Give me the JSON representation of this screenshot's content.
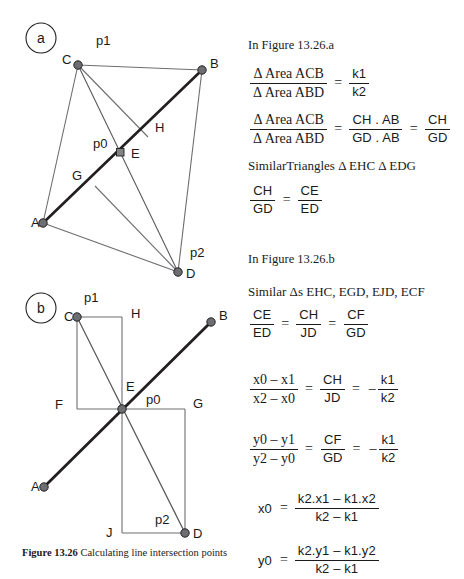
{
  "figure": {
    "caption_label": "Figure 13.26",
    "caption_text": " Calculating line intersection points",
    "panel_a": {
      "badge": "a",
      "points": [
        {
          "id": "A",
          "label": "A",
          "x": 43,
          "y": 223,
          "label_x": 31,
          "label_y": 227
        },
        {
          "id": "B",
          "label": "B",
          "x": 202,
          "y": 70,
          "label_x": 210,
          "label_y": 68
        },
        {
          "id": "C",
          "label": "C",
          "x": 78,
          "y": 65,
          "label_x": 62,
          "label_y": 64
        },
        {
          "id": "D",
          "label": "D",
          "x": 178,
          "y": 272,
          "label_x": 186,
          "label_y": 278
        },
        {
          "id": "E",
          "label": "E",
          "x": 120,
          "y": 152,
          "label_x": 131,
          "label_y": 158
        }
      ],
      "annotations": [
        {
          "id": "p1",
          "label": "p1",
          "x": 96,
          "y": 45
        },
        {
          "id": "p0",
          "label": "p0",
          "x": 93,
          "y": 148
        },
        {
          "id": "p2",
          "label": "p2",
          "x": 190,
          "y": 257
        },
        {
          "id": "G",
          "label": "G",
          "x": 72,
          "y": 180
        },
        {
          "id": "H",
          "label": "H",
          "x": 155,
          "y": 132
        }
      ]
    },
    "panel_b": {
      "badge": "b",
      "points": [
        {
          "id": "A",
          "label": "A",
          "x": 44,
          "y": 487,
          "label_x": 31,
          "label_y": 491
        },
        {
          "id": "B",
          "label": "B",
          "x": 211,
          "y": 322,
          "label_x": 219,
          "label_y": 320
        },
        {
          "id": "C",
          "label": "C",
          "x": 77,
          "y": 317,
          "label_x": 64,
          "label_y": 320
        },
        {
          "id": "D",
          "label": "D",
          "x": 185,
          "y": 533,
          "label_x": 193,
          "label_y": 538
        },
        {
          "id": "E",
          "label": "E",
          "x": 122,
          "y": 409,
          "label_x": 126,
          "label_y": 391
        }
      ],
      "annotations": [
        {
          "id": "p1",
          "label": "p1",
          "x": 84,
          "y": 302
        },
        {
          "id": "p0",
          "label": "p0",
          "x": 146,
          "y": 399
        },
        {
          "id": "p2",
          "label": "p2",
          "x": 155,
          "y": 521
        },
        {
          "id": "H",
          "label": "H",
          "x": 131,
          "y": 315
        },
        {
          "id": "F",
          "label": "F",
          "x": 59,
          "y": 405
        },
        {
          "id": "G",
          "label": "G",
          "x": 193,
          "y": 405
        },
        {
          "id": "J",
          "label": "J",
          "x": 110,
          "y": 533
        }
      ]
    },
    "colors": {
      "thick_line": "#231f20",
      "thin_line": "#58595b",
      "node_fill": "#6d6e71",
      "node_stroke": "#231f20",
      "badge_stroke": "#231f20"
    }
  },
  "math": {
    "heading_a": "In Figure 13.26.a",
    "heading_b": "In Figure 13.26.b",
    "eq1": {
      "lhs_num": "Δ Area ACB",
      "lhs_den": "Δ Area ABD",
      "eq": "=",
      "rhs_num": "k1",
      "rhs_den": "k2"
    },
    "eq2": {
      "lhs_num": "Δ Area ACB",
      "lhs_den": "Δ Area ABD",
      "eq1": "=",
      "mid_num": "CH . AB",
      "mid_den": "GD . AB",
      "eq2": "=",
      "rhs_num": "CH",
      "rhs_den": "GD"
    },
    "similar_a": "SimilarTriangles Δ EHC  Δ EDG",
    "eq3": {
      "lhs_num": "CH",
      "lhs_den": "GD",
      "eq": "=",
      "rhs_num": "CE",
      "rhs_den": "ED"
    },
    "similar_b": "Similar Δs EHC, EGD, EJD, ECF",
    "eq4": {
      "a_num": "CE",
      "a_den": "ED",
      "eq1": "=",
      "b_num": "CH",
      "b_den": "JD",
      "eq2": "=",
      "c_num": "CF",
      "c_den": "GD"
    },
    "eq5": {
      "a_num": "x0 – x1",
      "a_den": "x2 – x0",
      "eq1": "=",
      "b_num": "CH",
      "b_den": "JD",
      "eq2": "=",
      "minus": "–",
      "c_num": "k1",
      "c_den": "k2"
    },
    "eq6": {
      "a_num": "y0 – y1",
      "a_den": "y2 – y0",
      "eq1": "=",
      "b_num": "CF",
      "b_den": "GD",
      "eq2": "=",
      "minus": "–",
      "c_num": "k1",
      "c_den": "k2"
    },
    "eq7": {
      "lhs": "x0",
      "eq": "=",
      "num": "k2.x1 – k1.x2",
      "den": "k2 – k1"
    },
    "eq8": {
      "lhs": "y0",
      "eq": "=",
      "num": "k2.y1 – k1.y2",
      "den": "k2 – k1"
    }
  }
}
